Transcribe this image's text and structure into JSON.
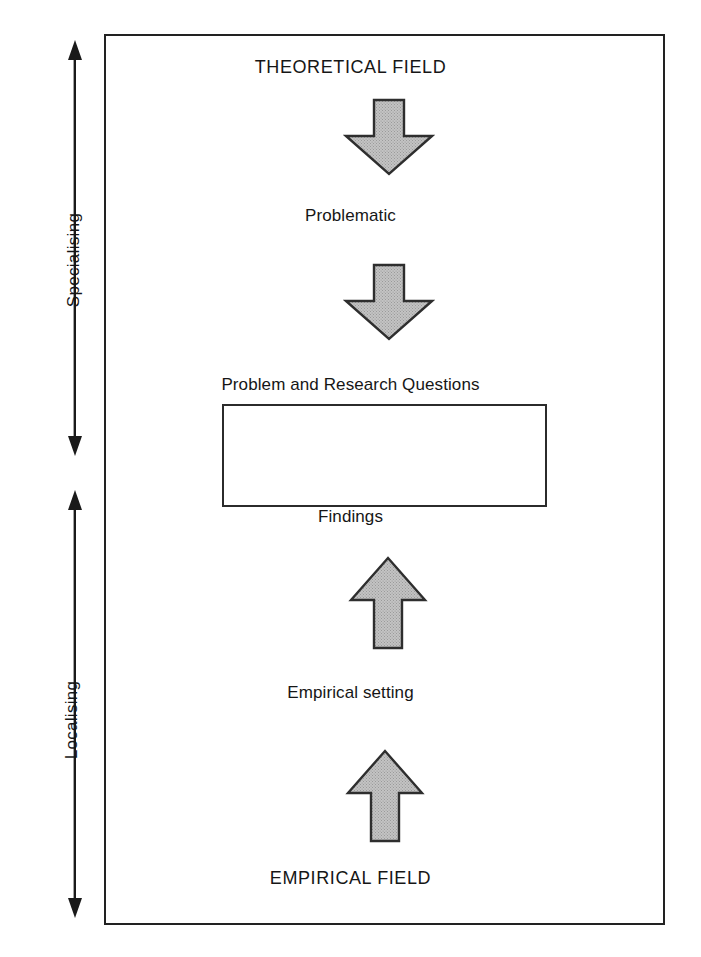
{
  "diagram": {
    "frame": {
      "border_color": "#222222"
    },
    "axis": [
      {
        "id": "specialising",
        "label": "Specialising",
        "icon": "double-headed-vertical-arrow-icon",
        "orientation": "vertical",
        "direction": "both"
      },
      {
        "id": "localising",
        "label": "Localising",
        "icon": "double-headed-vertical-arrow-icon",
        "orientation": "vertical",
        "direction": "both"
      }
    ],
    "nodes": [
      {
        "id": "theoretical-field",
        "label": "THEORETICAL FIELD",
        "style": "caps"
      },
      {
        "id": "problematic",
        "label": "Problematic",
        "style": "mixed"
      },
      {
        "id": "problem-questions",
        "label": "Problem and Research Questions",
        "style": "mixed"
      },
      {
        "id": "findings",
        "label": "Findings",
        "style": "mixed"
      },
      {
        "id": "empirical-setting",
        "label": "Empirical setting",
        "style": "mixed"
      },
      {
        "id": "empirical-field",
        "label": "EMPIRICAL FIELD",
        "style": "caps"
      }
    ],
    "box": {
      "id": "problem-questions-box",
      "label": "",
      "border_color": "#2b2b2b",
      "fill_color": "#ffffff"
    },
    "arrows": [
      {
        "id": "theoretical-to-problematic",
        "icon": "block-arrow-down-icon",
        "direction": "down",
        "from": "THEORETICAL FIELD",
        "to": "Problematic",
        "fill_color": "#b9b9b9",
        "stroke_color": "#303030"
      },
      {
        "id": "problematic-to-problem-questions",
        "icon": "block-arrow-down-icon",
        "direction": "down",
        "from": "Problematic",
        "to": "Problem and Research Questions",
        "fill_color": "#b9b9b9",
        "stroke_color": "#303030"
      },
      {
        "id": "empirical-setting-to-findings",
        "icon": "block-arrow-up-icon",
        "direction": "up",
        "from": "Empirical setting",
        "to": "Findings",
        "fill_color": "#b9b9b9",
        "stroke_color": "#303030"
      },
      {
        "id": "empirical-field-to-empirical-setting",
        "icon": "block-arrow-up-icon",
        "direction": "up",
        "from": "EMPIRICAL FIELD",
        "to": "Empirical setting",
        "fill_color": "#b9b9b9",
        "stroke_color": "#303030"
      }
    ]
  }
}
